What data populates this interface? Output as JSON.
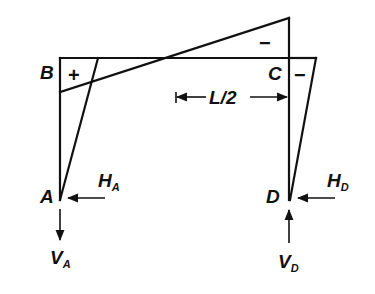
{
  "figure": {
    "joints": {
      "A": "A",
      "B": "B",
      "C": "C",
      "D": "D"
    },
    "moment_signs": {
      "left_corner": "+",
      "top_right": "−",
      "right_column": "−"
    },
    "dimension": {
      "label_main": "L",
      "label_slash": "/",
      "label_den": "2"
    },
    "reactions": {
      "H_A": {
        "main": "H",
        "sub": "A",
        "direction": "left"
      },
      "V_A": {
        "main": "V",
        "sub": "A",
        "direction": "down"
      },
      "H_D": {
        "main": "H",
        "sub": "D",
        "direction": "left"
      },
      "V_D": {
        "main": "V",
        "sub": "D",
        "direction": "up"
      }
    }
  }
}
